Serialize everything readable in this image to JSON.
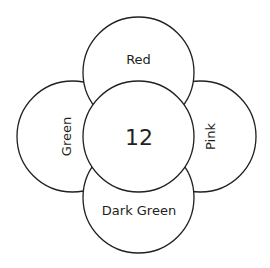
{
  "diagram": {
    "center": {
      "label": "12"
    },
    "petals": {
      "top": {
        "label": "Red"
      },
      "left": {
        "label": "Green"
      },
      "right": {
        "label": "Pink"
      },
      "bottom": {
        "label": "Dark Green"
      }
    },
    "colors": {
      "stroke": "#231f20",
      "fill": "#ffffff",
      "text": "#231f20"
    }
  }
}
